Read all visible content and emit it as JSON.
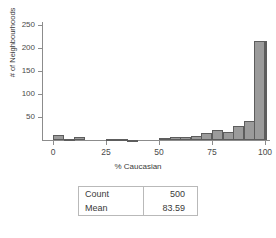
{
  "chart_data": {
    "type": "bar",
    "title": "",
    "subtitle": "",
    "xlabel": "% Caucasian",
    "ylabel": "# of Neighbourhoods",
    "xlim": [
      0,
      100
    ],
    "ylim": [
      0,
      260
    ],
    "xticks": [
      0,
      25,
      50,
      75,
      100
    ],
    "xtick_labels": [
      "0",
      "25",
      "50",
      "75",
      "100"
    ],
    "yticks": [
      50,
      100,
      150,
      200,
      250
    ],
    "ytick_labels": [
      "50",
      "100",
      "150",
      "200",
      "250"
    ],
    "grid": false,
    "legend": null,
    "bin_width": 5,
    "bin_starts": [
      0,
      5,
      10,
      15,
      20,
      25,
      30,
      35,
      40,
      45,
      50,
      55,
      60,
      65,
      70,
      75,
      80,
      85,
      90,
      95
    ],
    "categories": [
      "0-5",
      "5-10",
      "10-15",
      "15-20",
      "20-25",
      "25-30",
      "30-35",
      "35-40",
      "40-45",
      "45-50",
      "50-55",
      "55-60",
      "60-65",
      "65-70",
      "70-75",
      "75-80",
      "80-85",
      "85-90",
      "90-95",
      "95-100"
    ],
    "values": [
      11,
      3,
      6,
      0,
      0,
      3,
      3,
      1,
      0,
      0,
      5,
      6,
      6,
      9,
      15,
      22,
      17,
      31,
      42,
      85
    ],
    "last_value": 216,
    "bar_color": "#9b9b9b",
    "bar_edge_color": "#5d5d5d",
    "axis_color": "#8c8c8c"
  },
  "chart": {
    "bars": [
      {
        "bin": "0-5",
        "value": 11
      },
      {
        "bin": "5-10",
        "value": 3
      },
      {
        "bin": "10-15",
        "value": 6
      },
      {
        "bin": "15-20",
        "value": 0
      },
      {
        "bin": "20-25",
        "value": 0
      },
      {
        "bin": "25-30",
        "value": 3
      },
      {
        "bin": "30-35",
        "value": 3
      },
      {
        "bin": "35-40",
        "value": 1
      },
      {
        "bin": "40-45",
        "value": 0
      },
      {
        "bin": "45-50",
        "value": 0
      },
      {
        "bin": "50-55",
        "value": 5
      },
      {
        "bin": "55-60",
        "value": 6
      },
      {
        "bin": "60-65",
        "value": 6
      },
      {
        "bin": "65-70",
        "value": 9
      },
      {
        "bin": "70-75",
        "value": 15
      },
      {
        "bin": "75-80",
        "value": 22
      },
      {
        "bin": "80-85",
        "value": 17
      },
      {
        "bin": "85-90",
        "value": 31
      },
      {
        "bin": "90-95",
        "value": 42
      },
      {
        "bin": "95-100",
        "value": 85
      },
      {
        "bin": "100",
        "value": 216
      }
    ]
  },
  "stats_table": {
    "rows": [
      {
        "label": "Count",
        "value": "500"
      },
      {
        "label": "Mean",
        "value": "83.59"
      }
    ]
  }
}
